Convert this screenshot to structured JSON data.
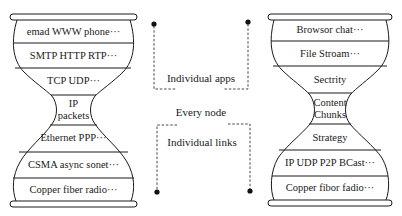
{
  "diagram": {
    "type": "dual-hourglass",
    "left_hourglass": {
      "layers": [
        {
          "label": "emad WWW phone···"
        },
        {
          "label": "SMTP HTTP RTP···"
        },
        {
          "label": "TCP UDP···"
        },
        {
          "label_line1": "IP",
          "label_line2": "packets"
        },
        {
          "label": "Ethernet PPP···"
        },
        {
          "label": "CSMA async sonet···"
        },
        {
          "label": "Copper fiber radio···"
        }
      ]
    },
    "right_hourglass": {
      "layers": [
        {
          "label": "Browsor chat···"
        },
        {
          "label": "File Stroam···"
        },
        {
          "label": "Sectrity"
        },
        {
          "label_line1": "Content",
          "label_line2": "Chunks"
        },
        {
          "label": "Strategy"
        },
        {
          "label": "IP UDP P2P BCast···"
        },
        {
          "label": "Copper fibor fadio···"
        }
      ]
    },
    "middle": {
      "top_label": "Individual apps",
      "center_label": "Every node",
      "bottom_label": "Individual links"
    },
    "colors": {
      "stroke": "#1a1a1a",
      "background": "#ffffff"
    }
  }
}
